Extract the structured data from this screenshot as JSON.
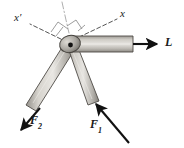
{
  "figure": {
    "type": "mechanics-free-body-diagram",
    "background_color": "#ffffff",
    "labels": {
      "axis_x": "x",
      "axis_x_prime": "x′",
      "force_1": "F",
      "force_1_sub": "1",
      "force_2": "F",
      "force_2_sub": "2",
      "load": "L"
    },
    "colors": {
      "ink": "#1a1a1a",
      "arm_fill_light": "#e8e6e2",
      "arm_fill_mid": "#b9b6b0",
      "arm_fill_dark": "#8e8b85",
      "pivot_fill": "#a9a6a0",
      "dashed_line": "#4a4a4a",
      "dashdot_line": "#9a9a9a"
    },
    "geometry": {
      "pivot": {
        "x": 70,
        "y": 45
      },
      "load_arrow_tip": {
        "x": 160,
        "y": 44
      },
      "force1_arrow_tip": {
        "x": 96,
        "y": 104
      },
      "force2_arrow_tip": {
        "x": 25,
        "y": 126
      },
      "axis_x_end": {
        "x": 118,
        "y": 18
      },
      "axis_x_prime_end": {
        "x": 27,
        "y": 24
      }
    }
  }
}
